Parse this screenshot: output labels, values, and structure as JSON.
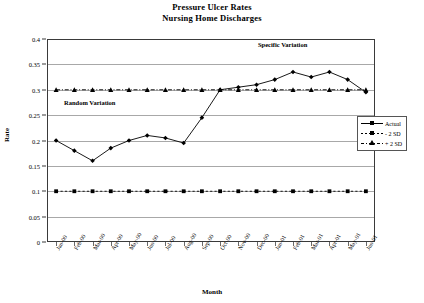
{
  "chart_data": {
    "type": "line",
    "title": "Pressure Ulcer Rates",
    "subtitle": "Nursing Home Discharges",
    "xlabel": "Month",
    "ylabel": "Rate",
    "ylim": [
      0,
      0.4
    ],
    "ytick_step": 0.05,
    "ytick_labels": [
      "0.4",
      "0.35",
      "0.3",
      "0.25",
      "0.2",
      "0.15",
      "0.1",
      "0.05",
      "0"
    ],
    "ytick_values": [
      0.4,
      0.35,
      0.3,
      0.25,
      0.2,
      0.15,
      0.1,
      0.05,
      0
    ],
    "grid": true,
    "legend_position": "right-middle",
    "categories": [
      "Jan-00",
      "Feb-00",
      "Mar-00",
      "Apr-00",
      "May-00",
      "Jun-00",
      "Jul-00",
      "Aug-00",
      "Sep-00",
      "Oct-00",
      "Nov-00",
      "Dec-00",
      "Jan-01",
      "Feb-01",
      "Mar-01",
      "Apr-01",
      "May-01",
      "Jun-01"
    ],
    "series": [
      {
        "name": "Actual",
        "marker": "diamond",
        "style": "solid",
        "color": "#000000",
        "values": [
          0.2,
          0.18,
          0.16,
          0.185,
          0.2,
          0.21,
          0.205,
          0.195,
          0.245,
          0.3,
          0.305,
          0.31,
          0.32,
          0.335,
          0.325,
          0.335,
          0.32,
          0.295
        ]
      },
      {
        "name": "- 2 SD",
        "marker": "square",
        "style": "dashed",
        "color": "#000000",
        "values": [
          0.1,
          0.1,
          0.1,
          0.1,
          0.1,
          0.1,
          0.1,
          0.1,
          0.1,
          0.1,
          0.1,
          0.1,
          0.1,
          0.1,
          0.1,
          0.1,
          0.1,
          0.1
        ]
      },
      {
        "name": "+ 2 SD",
        "marker": "triangle",
        "style": "dash-dot",
        "color": "#000000",
        "values": [
          0.3,
          0.3,
          0.3,
          0.3,
          0.3,
          0.3,
          0.3,
          0.3,
          0.3,
          0.3,
          0.3,
          0.3,
          0.3,
          0.3,
          0.3,
          0.3,
          0.3,
          0.3
        ]
      }
    ],
    "annotations": [
      {
        "text": "Random Variation",
        "x": "Mar-00",
        "y": 0.272
      },
      {
        "text": "Specific Variation",
        "x": "Nov-00",
        "y": 0.372
      }
    ]
  },
  "legend": {
    "items": [
      {
        "label": "Actual"
      },
      {
        "label": "- 2 SD"
      },
      {
        "label": "+ 2 SD"
      }
    ]
  }
}
